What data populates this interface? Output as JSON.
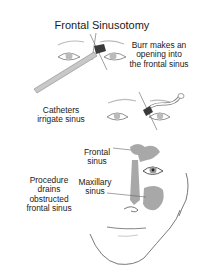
{
  "diagram": {
    "title": "Frontal Sinusotomy",
    "panels": [
      {
        "id": "burr",
        "caption_lines": [
          "Burr makes an",
          "opening into",
          "the frontal sinus"
        ]
      },
      {
        "id": "catheters",
        "caption_lines": [
          "Catheters",
          "irrigate sinus"
        ]
      },
      {
        "id": "drainage",
        "caption_lines": [
          "Procedure",
          "drains",
          "obstructed",
          "frontal sinus"
        ],
        "anatomy_labels": [
          {
            "lines": [
              "Frontal",
              "sinus"
            ]
          },
          {
            "lines": [
              "Maxillary",
              "sinus"
            ]
          }
        ]
      }
    ],
    "colors": {
      "line": "#555555",
      "sinus_fill": "#a8a8a8",
      "instrument": "#bdbdbd",
      "burr": "#3a3a3a",
      "iris": "#9a9a9a"
    }
  }
}
